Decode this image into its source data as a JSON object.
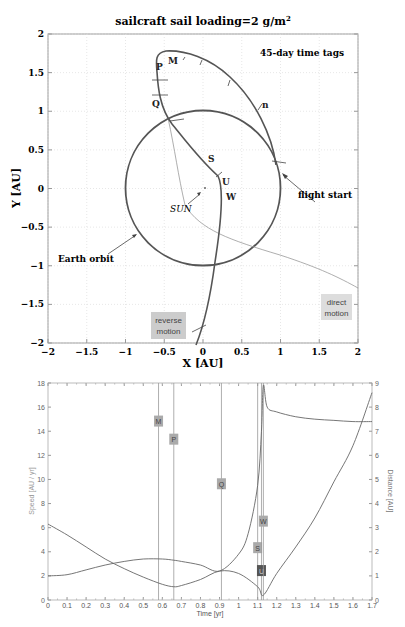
{
  "chart_data": [
    {
      "type": "line",
      "title": "sailcraft sail loading=2 g/m²",
      "title_main": "sailcraft sail loading=2 g/m",
      "title_sup": "2",
      "xlabel": "X [AU]",
      "ylabel": "Y [AU]",
      "xlim": [
        -2,
        2
      ],
      "ylim": [
        -2,
        2
      ],
      "grid": true,
      "x_ticks": [
        "-2",
        "-1.5",
        "-1",
        "-0.5",
        "0",
        "0.5",
        "1",
        "1.5",
        "2"
      ],
      "y_ticks": [
        "2",
        "1.5",
        "1",
        "0.5",
        "0",
        "-0.5",
        "-1",
        "-1.5",
        "-2"
      ],
      "annotations": {
        "time_tags": "45-day time tags",
        "flight_start": "flight start",
        "earth_orbit": "Earth orbit",
        "sun": "SUN",
        "direct_motion": "direct motion",
        "direct_line1": "direct",
        "direct_line2": "motion",
        "reverse_line1": "reverse",
        "reverse_line2": "motion"
      },
      "point_labels": [
        "M",
        "P",
        "Q",
        "n",
        "S",
        "U",
        "W"
      ],
      "series": [
        {
          "name": "Earth orbit",
          "shape": "circle",
          "center": [
            0,
            0
          ],
          "radius": 1
        },
        {
          "name": "sailcraft trajectory",
          "points": [
            [
              0.94,
              0.3
            ],
            [
              0.85,
              0.6
            ],
            [
              0.65,
              0.95
            ],
            [
              0.4,
              1.25
            ],
            [
              0.1,
              1.45
            ],
            [
              -0.3,
              1.55
            ],
            [
              -0.5,
              1.55
            ],
            [
              -0.58,
              1.45
            ],
            [
              -0.6,
              1.25
            ],
            [
              -0.55,
              1.05
            ],
            [
              -0.4,
              0.88
            ],
            [
              -0.1,
              0.55
            ],
            [
              0.15,
              0.3
            ],
            [
              0.27,
              0.15
            ],
            [
              0.25,
              -0.3
            ],
            [
              0.15,
              -1.0
            ],
            [
              0.05,
              -1.5
            ],
            [
              -0.12,
              -2.0
            ]
          ]
        },
        {
          "name": "direct motion trajectory",
          "points": [
            [
              -0.45,
              0.9
            ],
            [
              -0.35,
              0.5
            ],
            [
              -0.25,
              0.1
            ],
            [
              -0.1,
              -0.3
            ],
            [
              0.3,
              -0.55
            ],
            [
              1.0,
              -0.85
            ],
            [
              2.0,
              -1.3
            ]
          ]
        }
      ]
    },
    {
      "type": "line",
      "xlabel": "Time [yr]",
      "ylabel_left": "Speed [AU / yr]",
      "ylabel_right": "Distance [AU]",
      "xlim": [
        0,
        1.7
      ],
      "ylim_left": [
        0,
        18
      ],
      "ylim_right": [
        0,
        9
      ],
      "x_ticks": [
        "0",
        "0.1",
        "0.2",
        "0.3",
        "0.4",
        "0.5",
        "0.6",
        "0.7",
        "0.8",
        "0.9",
        "1",
        "1.1",
        "1.2",
        "1.3",
        "1.4",
        "1.5",
        "1.6",
        "1.7"
      ],
      "y_ticks_left": [
        "0",
        "2",
        "4",
        "6",
        "8",
        "10",
        "12",
        "14",
        "16",
        "18"
      ],
      "y_ticks_right": [
        "0",
        "1",
        "2",
        "3",
        "4",
        "5",
        "6",
        "7",
        "8",
        "9"
      ],
      "event_markers": [
        {
          "label": "M",
          "t": 0.58,
          "label_y": 14.8
        },
        {
          "label": "P",
          "t": 0.66,
          "label_y": 13.3
        },
        {
          "label": "Q",
          "t": 0.91,
          "label_y": 9.6
        },
        {
          "label": "S",
          "t": 1.1,
          "label_y": 4.3
        },
        {
          "label": "U",
          "t": 1.12,
          "label_y": 2.4
        },
        {
          "label": "W",
          "t": 1.13,
          "label_y": 6.5
        }
      ],
      "series": [
        {
          "name": "Speed",
          "axis": "left",
          "x": [
            0,
            0.1,
            0.2,
            0.3,
            0.4,
            0.5,
            0.6,
            0.66,
            0.7,
            0.8,
            0.9,
            1.0,
            1.05,
            1.1,
            1.12,
            1.13,
            1.15,
            1.2,
            1.3,
            1.4,
            1.5,
            1.6,
            1.7
          ],
          "y": [
            2.0,
            2.1,
            2.5,
            2.9,
            3.2,
            3.4,
            3.4,
            3.3,
            3.2,
            2.9,
            2.4,
            3.8,
            5.5,
            9.5,
            14,
            17.8,
            16,
            15.6,
            15.2,
            15.0,
            14.9,
            14.8,
            14.8
          ]
        },
        {
          "name": "Distance",
          "axis": "right",
          "x": [
            0,
            0.1,
            0.2,
            0.3,
            0.4,
            0.5,
            0.6,
            0.66,
            0.7,
            0.8,
            0.9,
            1.0,
            1.1,
            1.13,
            1.2,
            1.3,
            1.4,
            1.5,
            1.6,
            1.7
          ],
          "y": [
            3.15,
            2.7,
            2.2,
            1.7,
            1.3,
            0.95,
            0.65,
            0.55,
            0.6,
            0.85,
            1.2,
            1.1,
            0.55,
            0.2,
            1.1,
            2.2,
            3.4,
            4.9,
            6.4,
            8.6
          ]
        }
      ]
    }
  ]
}
